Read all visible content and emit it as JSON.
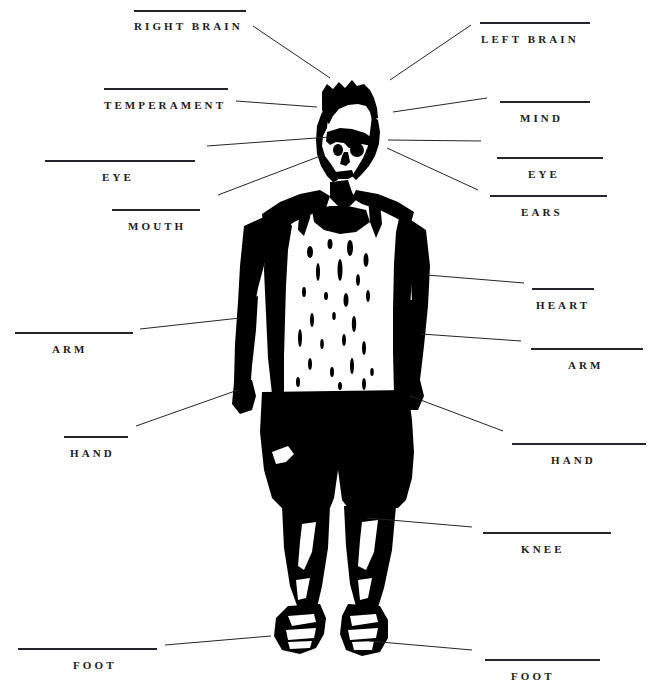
{
  "diagram": {
    "background_color": "#ffffff",
    "ink_color": "#000000",
    "rule_color": "#24242c",
    "text_color": "#1b1b22"
  },
  "labels": [
    {
      "id": "right-brain",
      "text": "RIGHT BRAIN",
      "side": "left",
      "rule": {
        "x": 134,
        "y": 10,
        "w": 112
      },
      "text_pos": {
        "x": 134,
        "y": 21
      },
      "leader": {
        "x1": 253,
        "y1": 26,
        "x2": 330,
        "y2": 78
      }
    },
    {
      "id": "left-brain",
      "text": "LEFT BRAIN",
      "side": "right",
      "rule": {
        "x": 480,
        "y": 22,
        "w": 110
      },
      "text_pos": {
        "x": 481,
        "y": 34
      },
      "leader": {
        "x1": 471,
        "y1": 25,
        "x2": 390,
        "y2": 80
      }
    },
    {
      "id": "temperament",
      "text": "TEMPERAMENT",
      "side": "left",
      "rule": {
        "x": 104,
        "y": 88,
        "w": 124
      },
      "text_pos": {
        "x": 104,
        "y": 100
      },
      "leader": {
        "x1": 236,
        "y1": 101,
        "x2": 317,
        "y2": 107
      }
    },
    {
      "id": "mind",
      "text": "MIND",
      "side": "right",
      "rule": {
        "x": 500,
        "y": 101,
        "w": 90
      },
      "text_pos": {
        "x": 520,
        "y": 113
      },
      "leader": {
        "x1": 487,
        "y1": 98,
        "x2": 393,
        "y2": 112
      }
    },
    {
      "id": "eye-left",
      "text": "EYE",
      "side": "left",
      "rule": {
        "x": 45,
        "y": 160,
        "w": 150
      },
      "text_pos": {
        "x": 102,
        "y": 172
      },
      "leader": {
        "x1": 207,
        "y1": 146,
        "x2": 330,
        "y2": 137
      }
    },
    {
      "id": "eye-right",
      "text": "EYE",
      "side": "right",
      "rule": {
        "x": 497,
        "y": 157,
        "w": 106
      },
      "text_pos": {
        "x": 528,
        "y": 169
      },
      "leader": {
        "x1": 481,
        "y1": 141,
        "x2": 388,
        "y2": 140
      }
    },
    {
      "id": "mouth",
      "text": "MOUTH",
      "side": "left",
      "rule": {
        "x": 112,
        "y": 209,
        "w": 88
      },
      "text_pos": {
        "x": 128,
        "y": 221
      },
      "leader": {
        "x1": 218,
        "y1": 195,
        "x2": 323,
        "y2": 155
      }
    },
    {
      "id": "ears",
      "text": "EARS",
      "side": "right",
      "rule": {
        "x": 490,
        "y": 195,
        "w": 117
      },
      "text_pos": {
        "x": 521,
        "y": 207
      },
      "leader": {
        "x1": 478,
        "y1": 190,
        "x2": 387,
        "y2": 148
      }
    },
    {
      "id": "heart",
      "text": "HEART",
      "side": "right",
      "rule": {
        "x": 532,
        "y": 288,
        "w": 62
      },
      "text_pos": {
        "x": 536,
        "y": 300
      },
      "leader": {
        "x1": 524,
        "y1": 283,
        "x2": 427,
        "y2": 275
      }
    },
    {
      "id": "arm-left",
      "text": "ARM",
      "side": "left",
      "rule": {
        "x": 15,
        "y": 332,
        "w": 118
      },
      "text_pos": {
        "x": 52,
        "y": 344
      },
      "leader": {
        "x1": 140,
        "y1": 329,
        "x2": 240,
        "y2": 318
      }
    },
    {
      "id": "arm-right",
      "text": "ARM",
      "side": "right",
      "rule": {
        "x": 531,
        "y": 348,
        "w": 112
      },
      "text_pos": {
        "x": 568,
        "y": 360
      },
      "leader": {
        "x1": 521,
        "y1": 341,
        "x2": 421,
        "y2": 334
      }
    },
    {
      "id": "hand-left",
      "text": "HAND",
      "side": "left",
      "rule": {
        "x": 64,
        "y": 436,
        "w": 64
      },
      "text_pos": {
        "x": 70,
        "y": 448
      },
      "leader": {
        "x1": 136,
        "y1": 426,
        "x2": 238,
        "y2": 390
      }
    },
    {
      "id": "hand-right",
      "text": "HAND",
      "side": "right",
      "rule": {
        "x": 512,
        "y": 443,
        "w": 134
      },
      "text_pos": {
        "x": 551,
        "y": 455
      },
      "leader": {
        "x1": 503,
        "y1": 431,
        "x2": 410,
        "y2": 396
      }
    },
    {
      "id": "knee",
      "text": "KNEE",
      "side": "right",
      "rule": {
        "x": 483,
        "y": 532,
        "w": 128
      },
      "text_pos": {
        "x": 521,
        "y": 544
      },
      "leader": {
        "x1": 472,
        "y1": 527,
        "x2": 367,
        "y2": 518
      }
    },
    {
      "id": "foot-left",
      "text": "FOOT",
      "side": "left",
      "rule": {
        "x": 18,
        "y": 648,
        "w": 139
      },
      "text_pos": {
        "x": 73,
        "y": 660
      },
      "leader": {
        "x1": 165,
        "y1": 645,
        "x2": 271,
        "y2": 636
      }
    },
    {
      "id": "foot-right",
      "text": "FOOT",
      "side": "right",
      "rule": {
        "x": 485,
        "y": 659,
        "w": 115
      },
      "text_pos": {
        "x": 511,
        "y": 671
      },
      "leader": {
        "x1": 472,
        "y1": 650,
        "x2": 369,
        "y2": 641
      }
    }
  ]
}
